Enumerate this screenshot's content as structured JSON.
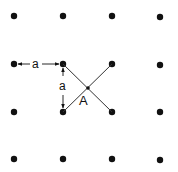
{
  "diagram": {
    "type": "square-lattice",
    "lattice_constant_label": "a",
    "point_label": "A",
    "colors": {
      "dot": "#111111",
      "line": "#333333",
      "background": "#ffffff"
    },
    "columns_x": [
      14,
      63,
      112,
      160
    ],
    "rows_y": [
      16,
      64,
      112,
      159
    ],
    "highlight_cell": {
      "tl": [
        63,
        64
      ],
      "tr": [
        112,
        64
      ],
      "bl": [
        63,
        112
      ],
      "br": [
        112,
        112
      ]
    },
    "center_point": [
      88,
      88
    ],
    "dimension_horizontal": {
      "label": "a",
      "from": [
        14,
        64
      ],
      "to": [
        63,
        64
      ]
    },
    "dimension_vertical": {
      "label": "a",
      "from": [
        63,
        64
      ],
      "to": [
        63,
        112
      ]
    }
  }
}
